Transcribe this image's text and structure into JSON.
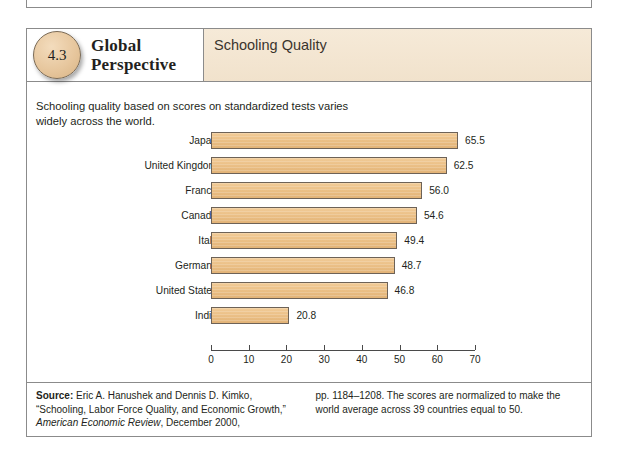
{
  "figure": {
    "badge_number": "4.3",
    "title_line1": "Global",
    "title_line2": "Perspective",
    "subject": "Schooling Quality",
    "intro": "Schooling quality based on scores on standardized tests varies widely across the world."
  },
  "chart_data": {
    "type": "bar",
    "orientation": "horizontal",
    "title": "Schooling Quality",
    "xlabel": "",
    "ylabel": "",
    "xlim": [
      0,
      70
    ],
    "grid": false,
    "legend": false,
    "categories": [
      "Japan",
      "United Kingdom",
      "France",
      "Canada",
      "Italy",
      "Germany",
      "United States",
      "India"
    ],
    "values": [
      65.5,
      62.5,
      56.0,
      54.6,
      49.4,
      48.7,
      46.8,
      20.8
    ],
    "value_labels": [
      "65.5",
      "62.5",
      "56.0",
      "54.6",
      "49.4",
      "48.7",
      "46.8",
      "20.8"
    ],
    "xticks": [
      0,
      10,
      20,
      30,
      40,
      50,
      60,
      70
    ],
    "xtick_labels": [
      "0",
      "10",
      "20",
      "30",
      "40",
      "50",
      "60",
      "70"
    ],
    "bar_color": "#eabe84",
    "bar_border_color": "#6d6257"
  },
  "footnote": {
    "source_label": "Source:",
    "left_line1": " Eric A. Hanushek and Dennis D. Kimko,",
    "left_line2": "“Schooling, Labor Force Quality, and Economic Growth,”",
    "left_line3_italic": "American Economic Review",
    "left_line3_rest": ", December 2000,",
    "right_line1": "pp. 1184–1208. The scores are normalized to make the",
    "right_line2": "world average across 39 countries equal to 50."
  },
  "colors": {
    "header_band": "#f3e6d2",
    "badge": "#e7c79e",
    "frame": "#8b8b8b"
  }
}
